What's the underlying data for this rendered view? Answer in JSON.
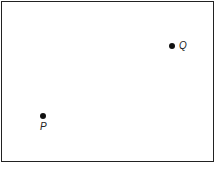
{
  "diagram": {
    "points": [
      {
        "name": "Q",
        "label": "Q",
        "x": 172,
        "y": 46,
        "label_pos": "right"
      },
      {
        "name": "P",
        "label": "P",
        "x": 43,
        "y": 116,
        "label_pos": "below"
      }
    ],
    "frame": {
      "stroke": "#222222"
    },
    "point_color": "#111111"
  }
}
